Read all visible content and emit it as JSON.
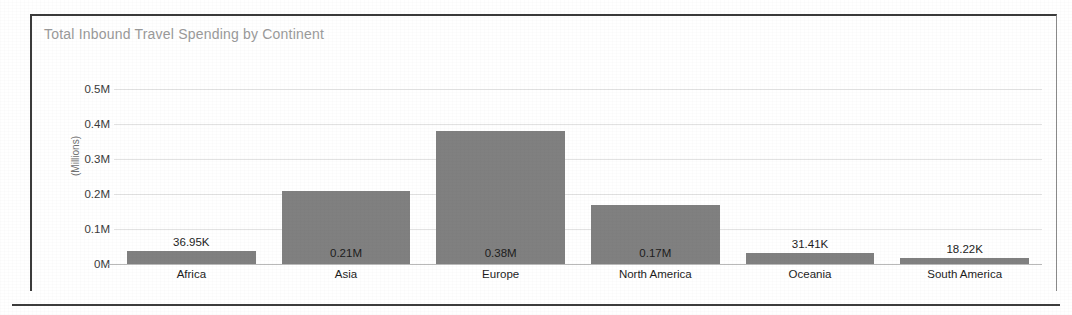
{
  "chart_data": {
    "type": "bar",
    "title": "Total Inbound Travel Spending by Continent",
    "xlabel": "",
    "ylabel": "(Millions)",
    "categories": [
      "Africa",
      "Asia",
      "Europe",
      "North America",
      "Oceania",
      "South America"
    ],
    "values": [
      36950,
      210000,
      380000,
      170000,
      31410,
      18220
    ],
    "data_labels": [
      "36.95K",
      "0.21M",
      "0.38M",
      "0.17M",
      "31.41K",
      "18.22K"
    ],
    "ylim": [
      0,
      500000
    ],
    "yticks": [
      500000,
      400000,
      300000,
      200000,
      100000,
      0
    ],
    "ytick_labels": [
      "0.5M",
      "0.4M",
      "0.3M",
      "0.2M",
      "0.1M",
      "0M"
    ],
    "grid": true,
    "legend": false,
    "series_color": "#808080",
    "title_color": "#9a9a9a",
    "gridline_color": "#e2e2e2",
    "axis_color": "#b9b9b9"
  }
}
